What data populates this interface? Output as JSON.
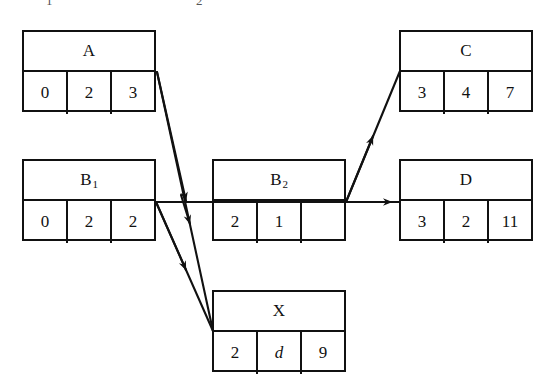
{
  "diagram": {
    "top_clipped_caption": {
      "left_fragment": "1",
      "right_fragment": "2"
    },
    "nodes": [
      {
        "id": "A",
        "label": "A",
        "label_sub": "",
        "cells": [
          "0",
          "2",
          "3"
        ],
        "cell_styles": [
          "plain",
          "plain",
          "plain"
        ],
        "x": 22,
        "y": 30,
        "w": 134,
        "h": 82
      },
      {
        "id": "B1",
        "label": "B",
        "label_sub": "1",
        "cells": [
          "0",
          "2",
          "2"
        ],
        "cell_styles": [
          "plain",
          "plain",
          "plain"
        ],
        "x": 22,
        "y": 159,
        "w": 134,
        "h": 82
      },
      {
        "id": "B2",
        "label": "B",
        "label_sub": "2",
        "cells": [
          "2",
          "1",
          ""
        ],
        "cell_styles": [
          "plain",
          "plain",
          "plain"
        ],
        "x": 212,
        "y": 159,
        "w": 134,
        "h": 82
      },
      {
        "id": "C",
        "label": "C",
        "label_sub": "",
        "cells": [
          "3",
          "4",
          "7"
        ],
        "cell_styles": [
          "plain",
          "plain",
          "plain"
        ],
        "x": 399,
        "y": 30,
        "w": 134,
        "h": 82
      },
      {
        "id": "D",
        "label": "D",
        "label_sub": "",
        "cells": [
          "3",
          "2",
          "11"
        ],
        "cell_styles": [
          "plain",
          "plain",
          "plain"
        ],
        "x": 399,
        "y": 159,
        "w": 134,
        "h": 82
      },
      {
        "id": "X",
        "label": "X",
        "label_sub": "",
        "cells": [
          "2",
          "d",
          "9"
        ],
        "cell_styles": [
          "plain",
          "italic",
          "plain"
        ],
        "x": 212,
        "y": 290,
        "w": 134,
        "h": 82
      }
    ],
    "edges": [
      {
        "id": "A-to-X",
        "from": "A",
        "to": "X",
        "kind": "diagonal-down-right"
      },
      {
        "id": "A-to-B2",
        "from": "A",
        "to": "B2",
        "kind": "diagonal-down-right-short"
      },
      {
        "id": "B1-to-X",
        "from": "B1",
        "to": "X",
        "kind": "diagonal-down-right"
      },
      {
        "id": "B1-to-D",
        "from": "B1",
        "to": "D",
        "kind": "horizontal"
      },
      {
        "id": "B2-to-C",
        "from": "B2",
        "to": "C",
        "kind": "diagonal-up-right"
      }
    ],
    "colors": {
      "stroke": "#111111",
      "background": "#ffffff",
      "text": "#111111"
    }
  }
}
